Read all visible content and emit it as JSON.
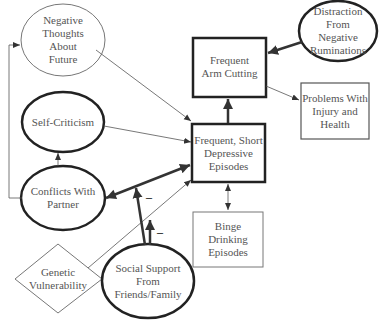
{
  "diagram": {
    "nodes": {
      "negative_thoughts": {
        "lines": [
          "Negative",
          "Thoughts",
          "About",
          "Future"
        ],
        "shape": "ellipse",
        "border": "thin"
      },
      "self_criticism": {
        "lines": [
          "Self-Criticism"
        ],
        "shape": "ellipse",
        "border": "thick"
      },
      "conflicts_partner": {
        "lines": [
          "Conflicts With",
          "Partner"
        ],
        "shape": "ellipse",
        "border": "thick"
      },
      "genetic_vulnerability": {
        "lines": [
          "Genetic",
          "Vulnerability"
        ],
        "shape": "diamond",
        "border": "thin"
      },
      "social_support": {
        "lines": [
          "Social Support",
          "From",
          "Friends/Family"
        ],
        "shape": "ellipse",
        "border": "thick"
      },
      "arm_cutting": {
        "lines": [
          "Frequent",
          "Arm Cutting"
        ],
        "shape": "rect",
        "border": "thick"
      },
      "distraction": {
        "lines": [
          "Distraction",
          "From",
          "Negative",
          "Ruminations"
        ],
        "shape": "ellipse",
        "border": "thick"
      },
      "problems_injury": {
        "lines": [
          "Problems With",
          "Injury and",
          "Health"
        ],
        "shape": "rect",
        "border": "thin"
      },
      "depressive_episodes": {
        "lines": [
          "Frequent, Short",
          "Depressive",
          "Episodes"
        ],
        "shape": "rect",
        "border": "thick"
      },
      "binge_drinking": {
        "lines": [
          "Binge",
          "Drinking",
          "Episodes"
        ],
        "shape": "rect",
        "border": "thin"
      }
    },
    "edges": [
      {
        "from": "Negative Thoughts About Future",
        "to": "Frequent, Short Depressive Episodes",
        "weight": "thin"
      },
      {
        "from": "Self-Criticism",
        "to": "Frequent, Short Depressive Episodes",
        "weight": "thin"
      },
      {
        "from": "Conflicts With Partner",
        "to": "Frequent, Short Depressive Episodes",
        "weight": "thick",
        "bidirectional": true
      },
      {
        "from": "Conflicts With Partner",
        "to": "Self-Criticism",
        "weight": "thin"
      },
      {
        "from": "Conflicts With Partner",
        "to": "Negative Thoughts About Future",
        "weight": "thin"
      },
      {
        "from": "Genetic Vulnerability",
        "to": "Frequent, Short Depressive Episodes",
        "weight": "thin"
      },
      {
        "from": "Social Support From Friends/Family",
        "to": "Conflicts-Depressive link",
        "weight": "thick",
        "sign": "–"
      },
      {
        "from": "Social Support From Friends/Family",
        "to": "Genetic-Depressive link",
        "weight": "thick",
        "sign": "–"
      },
      {
        "from": "Frequent, Short Depressive Episodes",
        "to": "Frequent Arm Cutting",
        "weight": "thick"
      },
      {
        "from": "Distraction From Negative Ruminations",
        "to": "Frequent Arm Cutting",
        "weight": "thick"
      },
      {
        "from": "Frequent Arm Cutting",
        "to": "Problems With Injury and Health",
        "weight": "thin"
      },
      {
        "from": "Frequent, Short Depressive Episodes",
        "to": "Binge Drinking Episodes",
        "weight": "thin",
        "bidirectional": true
      }
    ],
    "signs": {
      "minus1": "–",
      "minus2": "–"
    },
    "colors": {
      "line": "#333333",
      "thin_line": "#666666",
      "text": "#555555",
      "bg": "#ffffff"
    }
  }
}
